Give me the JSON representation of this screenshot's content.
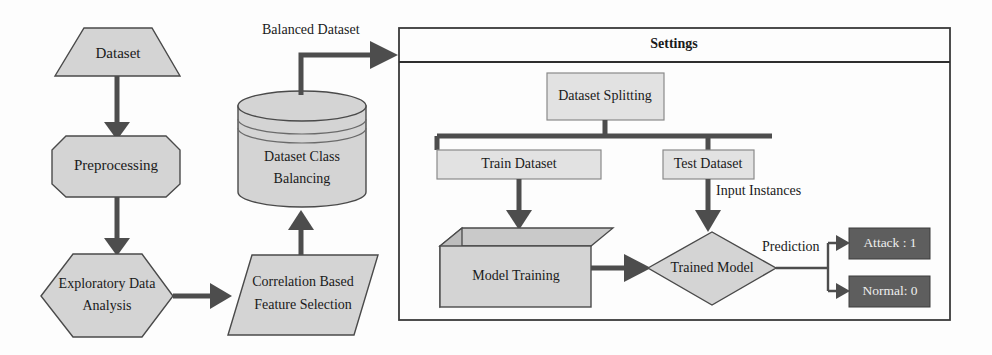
{
  "diagram": {
    "colors": {
      "node_fill": "#d4d4d4",
      "node_fill_light": "#e2e2e2",
      "node_fill_dark": "#5e5e5e",
      "stroke": "#4a4a4a",
      "connector": "#4d4d4d",
      "panel_border": "#3a3a3a",
      "background": "#fdfdfd",
      "text_dark": "#1a1a1a",
      "text_light": "#eeeeee"
    },
    "pipeline": {
      "dataset": {
        "label": "Dataset",
        "shape": "trapezoid"
      },
      "preprocessing": {
        "label": "Preprocessing",
        "shape": "octagon"
      },
      "eda": {
        "label_line1": "Exploratory Data",
        "label_line2": "Analysis",
        "shape": "hexagon"
      },
      "feature_selection": {
        "label_line1": "Correlation Based",
        "label_line2": "Feature Selection",
        "shape": "parallelogram"
      },
      "class_balancing": {
        "label_line1": "Dataset Class",
        "label_line2": "Balancing",
        "shape": "cylinder"
      }
    },
    "panel": {
      "title": "Settings",
      "nodes": {
        "dataset_splitting": {
          "label": "Dataset Splitting",
          "shape": "rectangle"
        },
        "train_dataset": {
          "label": "Train Dataset",
          "shape": "rectangle"
        },
        "test_dataset": {
          "label": "Test Dataset",
          "shape": "rectangle"
        },
        "model_training": {
          "label": "Model Training",
          "shape": "cube"
        },
        "trained_model": {
          "label": "Trained Model",
          "shape": "diamond"
        }
      },
      "outputs": [
        {
          "label": "Attack : 1",
          "shape": "rectangle",
          "style": "dark"
        },
        {
          "label": "Normal: 0",
          "shape": "rectangle",
          "style": "dark"
        }
      ]
    },
    "edge_labels": {
      "balanced_dataset": "Balanced Dataset",
      "input_instances": "Input Instances",
      "prediction": "Prediction"
    }
  }
}
